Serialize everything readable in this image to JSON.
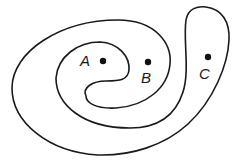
{
  "diagram": {
    "type": "closed-curve-regions",
    "stroke_color": "#1a1a1a",
    "background": "#ffffff",
    "points": [
      {
        "label": "A",
        "x": 103,
        "y": 61,
        "label_x": 84,
        "label_y": 67
      },
      {
        "label": "B",
        "x": 148,
        "y": 62,
        "label_x": 141,
        "label_y": 82
      },
      {
        "label": "C",
        "x": 208,
        "y": 57,
        "label_x": 199,
        "label_y": 77
      }
    ]
  }
}
